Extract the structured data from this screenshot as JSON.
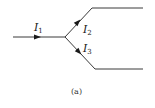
{
  "diagram": {
    "type": "current-junction",
    "caption": "(a)",
    "colors": {
      "wire": "#3a3a3a",
      "arrow": "#1a1a1a",
      "text": "#1a1a1a"
    },
    "junction": {
      "x": 65,
      "y": 37
    },
    "branches": [
      {
        "id": "input",
        "current": {
          "symbol": "I",
          "subscript": "1"
        },
        "direction": "into-junction",
        "path": [
          [
            13,
            37
          ],
          [
            65,
            37
          ]
        ]
      },
      {
        "id": "upper",
        "current": {
          "symbol": "I",
          "subscript": "2"
        },
        "direction": "out-of-junction",
        "path": [
          [
            65,
            37
          ],
          [
            92,
            8
          ],
          [
            143,
            8
          ]
        ]
      },
      {
        "id": "lower",
        "current": {
          "symbol": "I",
          "subscript": "3"
        },
        "direction": "out-of-junction",
        "path": [
          [
            65,
            37
          ],
          [
            95,
            69
          ],
          [
            143,
            69
          ]
        ]
      }
    ]
  }
}
